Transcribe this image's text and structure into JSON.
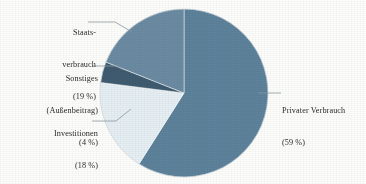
{
  "chart_data": {
    "type": "pie",
    "title": "",
    "subtitle": "",
    "xlabel": "",
    "ylabel": "",
    "legend_position": "callout-labels",
    "grid": false,
    "total_percent": 100,
    "start_angle_deg": 0,
    "direction": "clockwise",
    "categories": [
      "Privater Verbrauch",
      "Investitionen",
      "Sonstiges (Außenbeitrag)",
      "Staatsverbrauch"
    ],
    "values": [
      59,
      18,
      4,
      19
    ],
    "slices": [
      {
        "name": "Privater Verbrauch",
        "label_line1": "Privater Verbrauch",
        "label_line2": "(59 %)",
        "value": 59,
        "unit": "%",
        "color": "#5d829b",
        "start_deg": 0,
        "end_deg": 212.4
      },
      {
        "name": "Investitionen",
        "label_line1": "Investitionen",
        "label_line2": "(18 %)",
        "value": 18,
        "unit": "%",
        "color": "#e6eff4",
        "start_deg": 212.4,
        "end_deg": 277.2
      },
      {
        "name": "Sonstiges (Außenbeitrag)",
        "label_line1": "Sonstiges",
        "label_line2": "(Außenbeitrag)",
        "label_line3": "(4 %)",
        "value": 4,
        "unit": "%",
        "color": "#3f5b70",
        "start_deg": 277.2,
        "end_deg": 291.6
      },
      {
        "name": "Staatsverbrauch",
        "label_line1": "Staats-",
        "label_line2": "verbrauch",
        "label_line3": "(19 %)",
        "value": 19,
        "unit": "%",
        "color": "#6b8ba3",
        "start_deg": 291.6,
        "end_deg": 360
      }
    ]
  },
  "labels": {
    "staatsverbrauch": {
      "line1": "Staats-",
      "line2": "verbrauch",
      "line3": "(19 %)"
    },
    "sonstiges": {
      "line1": "Sonstiges",
      "line2": "(Außenbeitrag)",
      "line3": "(4 %)"
    },
    "investitionen": {
      "line1": "Investitionen",
      "line2": "(18 %)"
    },
    "privater_verbrauch": {
      "line1": "Privater Verbrauch",
      "line2": "(59 %)"
    }
  },
  "style": {
    "background": "#fdfdfb",
    "leader_line_color": "#8d9aa2",
    "text_color": "#2b2b2b",
    "outline_color": "#a8b6bf"
  }
}
